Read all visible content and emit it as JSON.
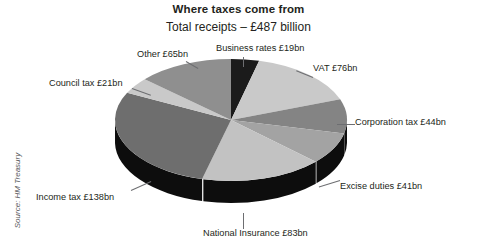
{
  "chart_data": {
    "type": "pie",
    "title": "Where taxes come from",
    "subtitle": "Total receipts – £487 billion",
    "source": "Source: HM Treasury",
    "unit": "£bn",
    "total": 487,
    "legend_position": "callout-labels",
    "grid": false,
    "categories": [
      "Business rates",
      "VAT",
      "Corporation tax",
      "Excise duties",
      "National Insurance",
      "Income tax",
      "Council tax",
      "Other"
    ],
    "values": [
      19,
      76,
      44,
      41,
      83,
      138,
      21,
      65
    ],
    "labels": [
      "Business rates £19bn",
      "VAT £76bn",
      "Corporation tax £44bn",
      "Excise duties £41bn",
      "National Insurance £83bn",
      "Income tax £138bn",
      "Council tax £21bn",
      "Other £65bn"
    ],
    "colors": [
      "#1b1b1b",
      "#c9c9c9",
      "#848484",
      "#a3a3a3",
      "#c2c2c2",
      "#6e6e6e",
      "#c9c9c9",
      "#8f8f8f"
    ],
    "side_colors": [
      "#111111",
      "#0d0d0d",
      "#0d0d0d",
      "#0d0d0d",
      "#0d0d0d",
      "#0d0d0d",
      "#0d0d0d",
      "#0d0d0d"
    ],
    "slices": [
      {
        "name": "Business rates",
        "value": 19,
        "label": "Business rates £19bn",
        "color": "#1b1b1b"
      },
      {
        "name": "VAT",
        "value": 76,
        "label": "VAT £76bn",
        "color": "#c9c9c9"
      },
      {
        "name": "Corporation tax",
        "value": 44,
        "label": "Corporation tax £44bn",
        "color": "#848484"
      },
      {
        "name": "Excise duties",
        "value": 41,
        "label": "Excise duties £41bn",
        "color": "#a3a3a3"
      },
      {
        "name": "National Insurance",
        "value": 83,
        "label": "National Insurance £83bn",
        "color": "#c2c2c2"
      },
      {
        "name": "Income tax",
        "value": 138,
        "label": "Income tax £138bn",
        "color": "#6e6e6e"
      },
      {
        "name": "Council tax",
        "value": 21,
        "label": "Council tax £21bn",
        "color": "#c9c9c9"
      },
      {
        "name": "Other",
        "value": 65,
        "label": "Other £65bn",
        "color": "#8f8f8f"
      }
    ]
  }
}
